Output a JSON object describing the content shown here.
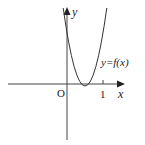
{
  "figure": {
    "type": "function-graph",
    "axes": {
      "x_label": "x",
      "y_label": "y",
      "origin_label": "O",
      "x_ticks": [
        {
          "value": 1,
          "label": "1"
        }
      ]
    },
    "curve": {
      "label": "y=f(x)",
      "shape": "parabola opening upward",
      "vertex": {
        "x": 0.5,
        "y": 0
      },
      "y_intercept_approx": 1.5
    },
    "colors": {
      "stroke": "#333333",
      "background": "#ffffff"
    }
  }
}
